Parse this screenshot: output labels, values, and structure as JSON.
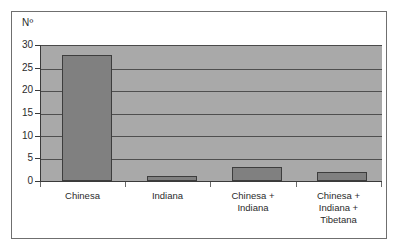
{
  "chart_data": {
    "type": "bar",
    "title": "",
    "subtitle": "",
    "xlabel": "",
    "ylabel": "Nº",
    "categories": [
      "Chinesa",
      "Indiana",
      "Chinesa +\nIndiana",
      "Chinesa +\nIndiana +\nTibetana"
    ],
    "values": [
      28,
      1,
      3,
      2
    ],
    "ylim": [
      0,
      30
    ],
    "yticks": [
      0,
      5,
      10,
      15,
      20,
      25,
      30
    ],
    "ytick_labels": [
      "0",
      "5",
      "10",
      "15",
      "20",
      "25",
      "30"
    ],
    "grid": true,
    "grid_axis": "y",
    "legend": false,
    "legend_position": "none",
    "series": [
      {
        "name": "Nº",
        "values": [
          28,
          1,
          3,
          2
        ]
      }
    ],
    "colors": {
      "bar_fill": "#808080",
      "bar_edge": "#3d3d3d",
      "plot_background": "#a9a9a9",
      "gridline": "#4f4f4f",
      "axis": "#3a3a3a",
      "frame": "#6f6f6f",
      "text": "#2b2b2b",
      "figure_background": "#ffffff"
    }
  }
}
